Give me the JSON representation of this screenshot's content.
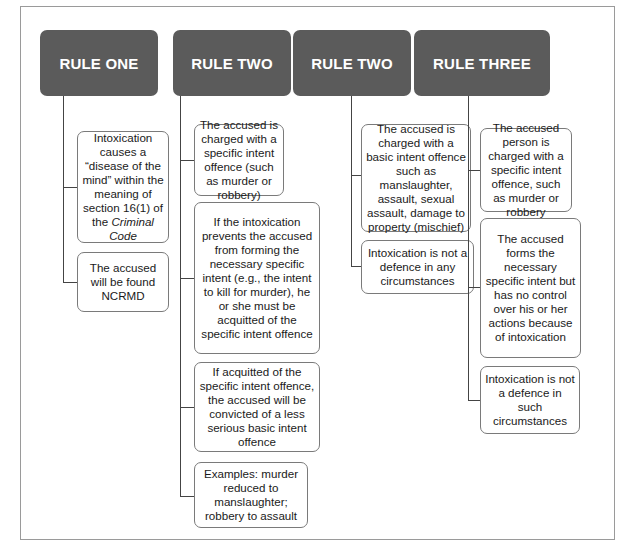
{
  "columns": [
    {
      "header": "RULE ONE",
      "boxes": [
        {
          "text": "Intoxication causes a “disease of the mind” within the meaning of section 16(1) of the",
          "italic_tail": "Criminal Code"
        },
        {
          "text": "The accused will be found NCRMD"
        }
      ]
    },
    {
      "header": "RULE TWO",
      "boxes": [
        {
          "text": "The accused is charged with a specific intent offence (such as murder or robbery)"
        },
        {
          "text": "If the intoxication prevents the accused from forming the necessary specific intent (e.g., the intent to kill for murder), he or she must be acquitted of the specific intent offence"
        },
        {
          "text": "If acquitted of the specific intent offence, the accused will be convicted of a less serious basic intent offence"
        },
        {
          "text": "Examples: murder reduced to manslaughter; robbery to assault"
        }
      ]
    },
    {
      "header": "RULE TWO",
      "boxes": [
        {
          "text": "The accused is charged with a basic intent offence such as manslaughter, assault, sexual assault, damage to property (mischief)"
        },
        {
          "text": "Intoxication is not a defence in any circumstances"
        }
      ]
    },
    {
      "header": "RULE THREE",
      "boxes": [
        {
          "text": "The accused person is charged with a specific intent offence, such as murder or robbery"
        },
        {
          "text": "The accused forms the necessary specific intent but has no control over his or her actions because of intoxication"
        },
        {
          "text": "Intoxication is not a defence in such circumstances"
        }
      ]
    }
  ],
  "colors": {
    "header_bg": "#5b5b5b",
    "header_text": "#ffffff",
    "box_border": "#7a7a7a",
    "connector": "#444444",
    "frame_border": "#9a9a9a"
  }
}
